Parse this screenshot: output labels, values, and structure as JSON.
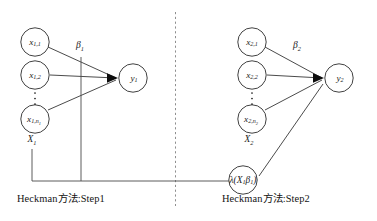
{
  "diagram": {
    "colors": {
      "background": "#ffffff",
      "stroke": "#2b2b2b",
      "divider": "#8f8f8f",
      "arrow": "#0d0d0d"
    },
    "step1": {
      "caption": "Heckman方法:Step1",
      "group_label": "X",
      "group_label_sub": "1",
      "coefficient_label": "β",
      "coefficient_label_sub": "1",
      "inputs": [
        {
          "base": "x",
          "sub": "1,1"
        },
        {
          "base": "x",
          "sub": "1,2"
        },
        {
          "base": "x",
          "sub": "1,n",
          "sub2": "1"
        }
      ],
      "ellipsis": "⋮",
      "output": {
        "base": "y",
        "sub": "1"
      }
    },
    "step2": {
      "caption": "Heckman方法:Step2",
      "group_label": "X",
      "group_label_sub": "2",
      "coefficient_label": "β",
      "coefficient_label_sub": "2",
      "inputs": [
        {
          "base": "x",
          "sub": "2,1"
        },
        {
          "base": "x",
          "sub": "2,2"
        },
        {
          "base": "x",
          "sub": "2,n",
          "sub2": "2"
        }
      ],
      "ellipsis": "⋮",
      "output": {
        "base": "y",
        "sub": "2"
      },
      "selection_term": {
        "lead": "λ(X",
        "lead_sub": "1",
        "mid": "β",
        "mid_sub": "1",
        "tail": ")"
      }
    }
  }
}
